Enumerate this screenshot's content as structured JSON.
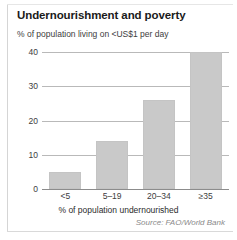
{
  "chart_data": {
    "type": "bar",
    "title": "Undernourishment and poverty",
    "subtitle": "% of population living on <US$1 per day",
    "categories": [
      "<5",
      "5–19",
      "20–34",
      "≥35"
    ],
    "values": [
      5,
      14,
      26,
      40
    ],
    "xlabel": "% of population undernourished",
    "ylabel": "% of population living on <US$1 per day",
    "ylim": [
      0,
      40
    ],
    "yticks": [
      0,
      10,
      20,
      30,
      40
    ],
    "ytick_labels": [
      "0",
      "10",
      "20",
      "30",
      "40"
    ],
    "grid": true,
    "legend": false,
    "source": "Source: FAO/World Bank",
    "bar_color": "#c9c9c9",
    "grid_color": "#b9b9b9",
    "axis_color": "#8c8c8c",
    "text_color": "#3d3d3d",
    "title_color": "#1a1a1a",
    "source_color": "#8a8a8a"
  }
}
